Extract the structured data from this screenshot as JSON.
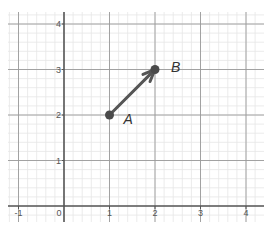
{
  "chart_data": {
    "type": "scatter",
    "title": "",
    "xlabel": "",
    "ylabel": "",
    "xlim": [
      -1.2,
      4.4
    ],
    "ylim": [
      -0.35,
      4.3
    ],
    "grid": true,
    "minor_grid": true,
    "x_ticks": [
      "-1",
      "0",
      "1",
      "2",
      "3",
      "4"
    ],
    "y_ticks": [
      "1",
      "2",
      "3",
      "4"
    ],
    "points": [
      {
        "label": "A",
        "x": 1,
        "y": 2
      },
      {
        "label": "B",
        "x": 2,
        "y": 3
      }
    ],
    "vectors": [
      {
        "from": "A",
        "to": "B",
        "from_xy": [
          1,
          2
        ],
        "to_xy": [
          2,
          3
        ]
      }
    ],
    "colors": {
      "major_grid": "#9a9a9a",
      "minor_grid": "#e6e6e6",
      "axis": "#555555",
      "vector": "#555555",
      "point": "#4a4a4a"
    }
  }
}
